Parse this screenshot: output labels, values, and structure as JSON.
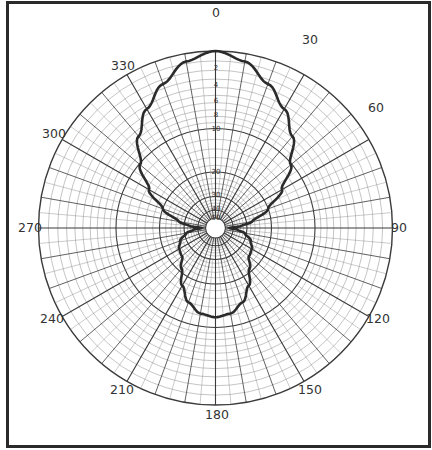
{
  "chart_data": {
    "type": "polar",
    "title": "",
    "angle_units": "degrees",
    "angle_zero": "top",
    "angle_direction": "clockwise",
    "angle_labels": [
      "0",
      "30",
      "60",
      "90",
      "120",
      "150",
      "180",
      "210",
      "240",
      "270",
      "300",
      "330"
    ],
    "radial_axis": {
      "units": "dB below maximum",
      "scale": "log (r = R·10^(-dB/40))",
      "tick_labels": [
        "2",
        "4",
        "6",
        "8",
        "10",
        "20",
        "30",
        "40",
        "50"
      ],
      "range": [
        0,
        50
      ]
    },
    "grid": {
      "radial_line_step_deg": 10,
      "major_radial_step_deg": 30,
      "on": true
    },
    "series": [
      {
        "name": "polar response",
        "angles": [
          0,
          10,
          20,
          30,
          40,
          50,
          60,
          70,
          80,
          85,
          90,
          95,
          100,
          110,
          120,
          130,
          140,
          150,
          160,
          170,
          180,
          190,
          200,
          210,
          220,
          230,
          240,
          250,
          260,
          265,
          270,
          275,
          280,
          290,
          300,
          310,
          320,
          330,
          340,
          350,
          360
        ],
        "db": [
          0,
          0.8,
          2.5,
          4.4,
          6.8,
          10.2,
          14.5,
          20,
          27,
          33,
          44,
          36,
          31,
          27,
          25,
          24.3,
          21,
          17,
          14,
          12.4,
          11.9,
          12.4,
          14,
          17,
          21,
          24.3,
          25,
          27,
          31,
          36,
          44,
          33,
          27,
          20,
          14.5,
          10.2,
          6.8,
          4.4,
          2.5,
          0.8,
          0
        ]
      }
    ]
  },
  "labels": {
    "a0": "0",
    "a30": "30",
    "a60": "60",
    "a90": "90",
    "a120": "120",
    "a150": "150",
    "a180": "180",
    "a210": "210",
    "a240": "240",
    "a270": "270",
    "a300": "300",
    "a330": "330",
    "d2": "2",
    "d4": "4",
    "d6": "6",
    "d8": "8",
    "d10": "10",
    "d20": "20",
    "d30": "30",
    "d40": "40",
    "d50": "50"
  },
  "colors": {
    "grid": "#3a3a3a",
    "grid_minor": "#8a8a8a",
    "trace": "#2b2b2b",
    "frame": "#2a2a2a"
  }
}
